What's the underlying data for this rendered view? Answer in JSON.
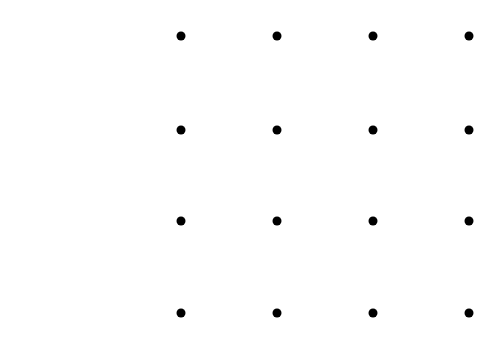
{
  "diagram": {
    "type": "dot-grid",
    "rows": 4,
    "cols": 4,
    "dot_color": "#000000",
    "background": "#ffffff",
    "col_x": [
      181,
      277,
      373,
      469
    ],
    "row_y": [
      36,
      130,
      221,
      313
    ],
    "dot_diameter": 9
  }
}
